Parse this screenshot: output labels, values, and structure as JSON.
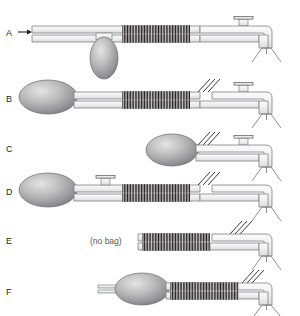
{
  "figure": {
    "background_color": "#ffffff",
    "ink_color": "#231f20",
    "tube_fill": "#f2f2f2",
    "tube_stroke": "#808285",
    "bag_fill_light": "#d9d9d9",
    "bag_fill_dark": "#808285",
    "corrugation_color": "#231f20",
    "note_color": "#58585b"
  },
  "rows": [
    {
      "id": "A",
      "label": "A",
      "note": "",
      "has_bag": true,
      "bag_orientation": "vertical-hanging",
      "has_inlet_arrow": true,
      "has_corrugated_tube": true,
      "has_top_port": true,
      "has_cut_marks": false,
      "has_y_piece": true
    },
    {
      "id": "B",
      "label": "B",
      "note": "",
      "has_bag": true,
      "bag_orientation": "horizontal-left",
      "has_inlet_arrow": false,
      "has_corrugated_tube": true,
      "has_top_port": true,
      "has_cut_marks": true,
      "has_y_piece": true
    },
    {
      "id": "C",
      "label": "C",
      "note": "",
      "has_bag": true,
      "bag_orientation": "horizontal-mid",
      "has_inlet_arrow": false,
      "has_corrugated_tube": false,
      "has_top_port": true,
      "has_cut_marks": true,
      "has_y_piece": true
    },
    {
      "id": "D",
      "label": "D",
      "note": "",
      "has_bag": true,
      "bag_orientation": "horizontal-left",
      "has_inlet_arrow": false,
      "has_corrugated_tube": true,
      "has_top_port": true,
      "has_cut_marks": true,
      "has_y_piece": true
    },
    {
      "id": "E",
      "label": "E",
      "note": "(no bag)",
      "has_bag": false,
      "bag_orientation": "none",
      "has_inlet_arrow": false,
      "has_corrugated_tube": true,
      "has_top_port": false,
      "has_cut_marks": true,
      "has_y_piece": true
    },
    {
      "id": "F",
      "label": "F",
      "note": "",
      "has_bag": true,
      "bag_orientation": "horizontal-mid-stub",
      "has_inlet_arrow": false,
      "has_corrugated_tube": true,
      "has_top_port": false,
      "has_cut_marks": true,
      "has_y_piece": true
    }
  ]
}
